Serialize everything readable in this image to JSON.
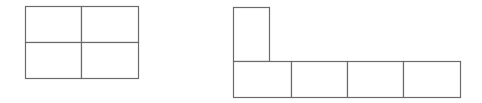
{
  "figures": [
    {
      "name": "rectangle-2x2-grid",
      "description": "Rectangle divided into 2 rows by 2 columns (4 equal cells)",
      "rows": 2,
      "cols": 2,
      "cells": [
        {
          "x": 25,
          "y": 6,
          "w": 56,
          "h": 36
        },
        {
          "x": 81,
          "y": 6,
          "w": 57,
          "h": 36
        },
        {
          "x": 25,
          "y": 42,
          "w": 56,
          "h": 36
        },
        {
          "x": 81,
          "y": 42,
          "w": 57,
          "h": 36
        }
      ]
    },
    {
      "name": "l-shaped-net",
      "description": "Row of 4 cells with one taller narrow cell on top of the leftmost cell",
      "cells": [
        {
          "x": 233,
          "y": 7,
          "w": 36,
          "h": 54
        },
        {
          "x": 233,
          "y": 61,
          "w": 58,
          "h": 36
        },
        {
          "x": 291,
          "y": 61,
          "w": 56,
          "h": 36
        },
        {
          "x": 347,
          "y": 61,
          "w": 56,
          "h": 36
        },
        {
          "x": 403,
          "y": 61,
          "w": 57,
          "h": 36
        }
      ]
    }
  ],
  "colors": {
    "stroke": "#6b6b6b",
    "background": "#ffffff"
  }
}
